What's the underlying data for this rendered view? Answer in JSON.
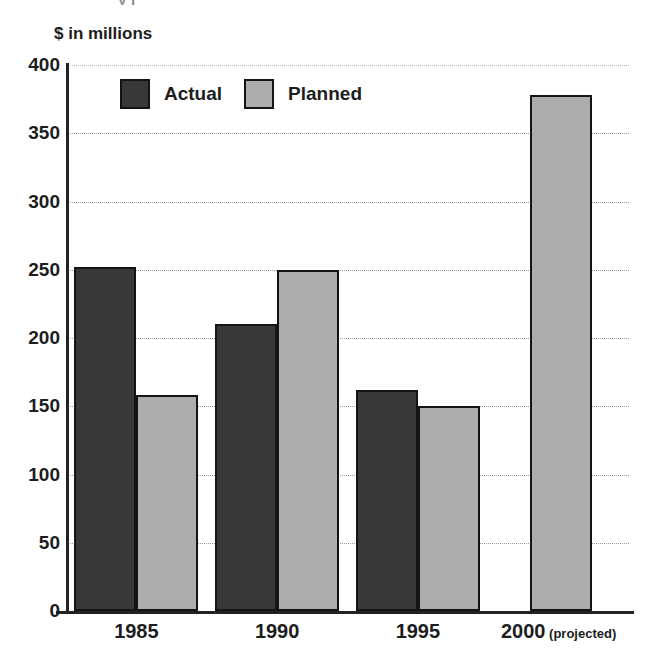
{
  "cropped_title_fragment": "y  j",
  "chart_data": {
    "type": "bar",
    "title": "",
    "ylabel": "$ in millions",
    "xlabel": "",
    "ylim": [
      0,
      400
    ],
    "yticks": [
      0,
      50,
      100,
      150,
      200,
      250,
      300,
      350,
      400
    ],
    "ytick_labels": [
      "0",
      "50",
      "100",
      "150",
      "200",
      "250",
      "300",
      "350",
      "400"
    ],
    "grid": true,
    "legend_position": "top-left-inside",
    "categories": [
      "1985",
      "1990",
      "1995",
      "2000"
    ],
    "category_suffixes": [
      "",
      "",
      "",
      " (projected)"
    ],
    "series": [
      {
        "name": "Actual",
        "color": "#383838",
        "values": [
          252,
          210,
          162,
          null
        ]
      },
      {
        "name": "Planned",
        "color": "#adadad",
        "values": [
          158,
          250,
          150,
          378
        ]
      }
    ]
  },
  "colors": {
    "actual": "#383838",
    "planned": "#adadad",
    "axis": "#222222",
    "gridline": "#9a9a9a",
    "bar_outline": "#141414",
    "text": "#1d1d1d",
    "background": "#ffffff"
  }
}
